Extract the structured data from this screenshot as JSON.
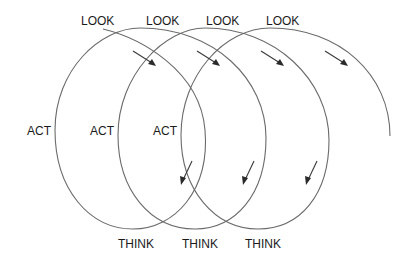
{
  "diagram": {
    "type": "spiral-cycle",
    "labels": {
      "look": [
        "LOOK",
        "LOOK",
        "LOOK",
        "LOOK"
      ],
      "act": [
        "ACT",
        "ACT",
        "ACT"
      ],
      "think": [
        "THINK",
        "THINK",
        "THINK"
      ]
    },
    "colors": {
      "line": "#6a6a6a",
      "arrow": "#3a3a3a",
      "text": "#1a1a1a",
      "background": "#ffffff"
    }
  }
}
